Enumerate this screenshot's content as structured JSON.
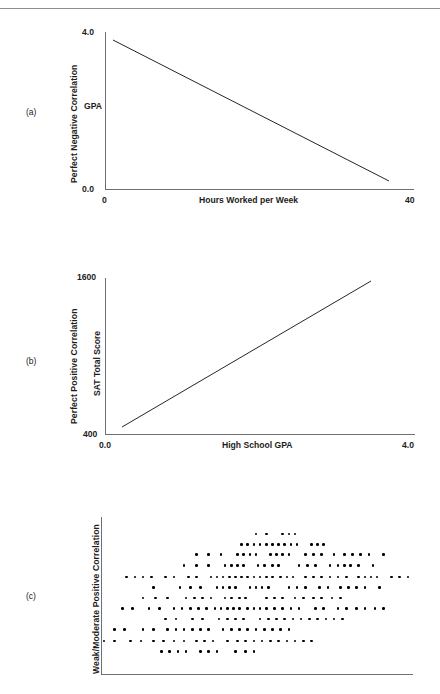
{
  "page": {
    "header_rule_visible": true,
    "header_ghost_text": "",
    "background": "#ffffff",
    "ink": "#1c1c1c",
    "axis_color": "#6f6f6f",
    "line_color": "#262626",
    "dot_color": "#000000"
  },
  "panels": [
    {
      "letter": "(a)",
      "outer_label": "Perfect Negative Correlation",
      "inner_label": "GPA",
      "y_ticks": [
        "4.0",
        "0.0"
      ],
      "x_ticks": [
        "0",
        "40"
      ],
      "x_title": "Hours Worked per Week"
    },
    {
      "letter": "(b)",
      "outer_label": "Perfect Positive Correlation",
      "inner_label": "SAT Total Score",
      "y_ticks": [
        "1600",
        "400"
      ],
      "x_ticks": [
        "0.0",
        "4.0"
      ],
      "x_title": "High School GPA"
    },
    {
      "letter": "(c)",
      "outer_label": "Weak/Moderate Positive Correlation",
      "inner_label": "",
      "y_ticks": [],
      "x_ticks": [],
      "x_title": ""
    }
  ],
  "chart_data": [
    {
      "type": "line",
      "panel": "(a)",
      "title": "Perfect Negative Correlation",
      "xlabel": "Hours Worked per Week",
      "ylabel": "GPA",
      "xlim": [
        0,
        40
      ],
      "ylim": [
        0.0,
        4.0
      ],
      "xticks": [
        0,
        40
      ],
      "xticklabels": [
        "0",
        "40"
      ],
      "yticks": [
        0.0,
        4.0
      ],
      "yticklabels": [
        "0.0",
        "4.0"
      ],
      "grid": false,
      "legend": null,
      "series": [
        {
          "name": "GPA vs Hours Worked",
          "x": [
            1.2,
            37.0
          ],
          "y": [
            3.82,
            0.22
          ]
        }
      ]
    },
    {
      "type": "line",
      "panel": "(b)",
      "title": "Perfect Positive Correlation",
      "xlabel": "High School GPA",
      "ylabel": "SAT Total Score",
      "xlim": [
        0.0,
        4.0
      ],
      "ylim": [
        400,
        1600
      ],
      "xticks": [
        0.0,
        4.0
      ],
      "xticklabels": [
        "0.0",
        "4.0"
      ],
      "yticks": [
        400,
        1600
      ],
      "yticklabels": [
        "400",
        "1600"
      ],
      "grid": false,
      "legend": null,
      "series": [
        {
          "name": "SAT vs High School GPA",
          "x": [
            0.22,
            3.45
          ],
          "y": [
            440,
            1560
          ]
        }
      ]
    },
    {
      "type": "scatter",
      "panel": "(c)",
      "title": "Weak/Moderate Positive Correlation",
      "xlabel": "",
      "ylabel": "",
      "xlim": [
        0,
        100
      ],
      "ylim": [
        0,
        100
      ],
      "xticks": [],
      "yticks": [],
      "grid": false,
      "legend": null,
      "point_count": 310,
      "rows": [
        {
          "y": 92,
          "x": [
            74,
            79,
            87,
            90,
            93
          ]
        },
        {
          "y": 85,
          "x": [
            67,
            70,
            73,
            76,
            79,
            82,
            85,
            88,
            91,
            94,
            101,
            104,
            107
          ]
        },
        {
          "y": 78,
          "x": [
            45,
            51,
            57,
            65,
            68,
            71,
            74,
            81,
            84,
            87,
            90,
            98,
            102,
            106,
            112,
            117,
            121,
            125,
            129,
            136
          ]
        },
        {
          "y": 71,
          "x": [
            39,
            45,
            51,
            59,
            62,
            65,
            68,
            75,
            78,
            82,
            85,
            95,
            99,
            103,
            110,
            114,
            117,
            120,
            124,
            131
          ]
        },
        {
          "y": 63,
          "x": [
            11,
            15,
            19,
            23,
            30,
            34,
            41,
            45,
            52,
            55,
            58,
            61,
            64,
            67,
            70,
            73,
            76,
            79,
            82,
            86,
            89,
            92,
            98,
            102,
            106,
            110,
            114,
            118,
            124,
            127,
            130,
            133,
            140,
            144,
            148
          ]
        },
        {
          "y": 56,
          "x": [
            24,
            37,
            42,
            47,
            55,
            58,
            61,
            64,
            71,
            74,
            77,
            80,
            90,
            94,
            98,
            105,
            109,
            115,
            119,
            123,
            127,
            134
          ]
        },
        {
          "y": 49,
          "x": [
            19,
            25,
            31,
            40,
            44,
            48,
            52,
            59,
            62,
            66,
            69,
            79,
            83,
            87,
            93,
            97,
            102,
            106,
            111,
            115
          ]
        },
        {
          "y": 42,
          "x": [
            9,
            14,
            22,
            27,
            34,
            38,
            42,
            46,
            50,
            54,
            57,
            60,
            63,
            66,
            70,
            73,
            76,
            79,
            83,
            87,
            91,
            95,
            103,
            107,
            114,
            118,
            123,
            127,
            132,
            136
          ]
        },
        {
          "y": 35,
          "x": [
            30,
            35,
            43,
            48,
            56,
            60,
            64,
            68,
            76,
            80,
            84,
            88,
            92,
            96,
            100,
            104,
            108,
            112,
            116
          ]
        },
        {
          "y": 28,
          "x": [
            5,
            10,
            19,
            24,
            31,
            35,
            39,
            43,
            47,
            51,
            58,
            62,
            66,
            70,
            74,
            78,
            82,
            86,
            90
          ]
        },
        {
          "y": 20,
          "x": [
            0,
            5,
            13,
            18,
            24,
            29,
            34,
            39,
            45,
            49,
            53,
            60,
            65,
            69,
            73,
            77,
            81,
            85,
            89,
            93,
            97,
            101
          ]
        },
        {
          "y": 13,
          "x": [
            28,
            32,
            36,
            40,
            47,
            51,
            55,
            64,
            69,
            73
          ]
        }
      ]
    }
  ]
}
